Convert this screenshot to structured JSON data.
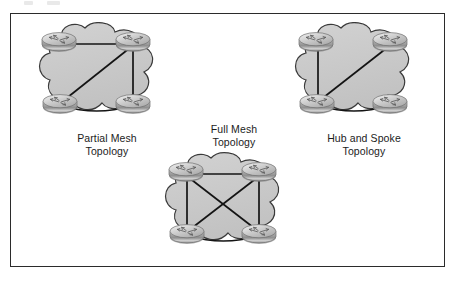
{
  "figure": {
    "background_color": "#ffffff",
    "border_color": "#2b2b2b",
    "cloud_fill_color": "#c9c9c9",
    "cloud_outline_color": "#2b2b2b",
    "link_color": "#1a1a1a",
    "router_body_color": "#b3b3b3",
    "router_top_color": "#d8d8d8",
    "label_color": "#1c1c1c"
  },
  "topologies": [
    {
      "id": "partial-mesh",
      "label": "Partial Mesh\nTopology",
      "label_line1": "Partial Mesh",
      "label_line2": "Topology",
      "device_count": 4,
      "device_type": "router",
      "link_count": 4,
      "links": [
        "top-left to top-right",
        "top-right to bottom-right",
        "bottom-left to bottom-right",
        "top-right to bottom-left"
      ]
    },
    {
      "id": "full-mesh",
      "label": "Full Mesh\nTopology",
      "label_line1": "Full Mesh",
      "label_line2": "Topology",
      "device_count": 4,
      "device_type": "router",
      "link_count": 6,
      "links": [
        "top-left to top-right",
        "top-left to bottom-left",
        "top-right to bottom-right",
        "bottom-left to bottom-right",
        "top-left to bottom-right",
        "top-right to bottom-left"
      ]
    },
    {
      "id": "hub-spoke",
      "label": "Hub and Spoke\nTopology",
      "label_line1": "Hub and Spoke",
      "label_line2": "Topology",
      "device_count": 4,
      "device_type": "router",
      "link_count": 3,
      "hub": "bottom-left",
      "links": [
        "bottom-left to top-left",
        "bottom-left to top-right",
        "bottom-left to bottom-right"
      ]
    }
  ]
}
